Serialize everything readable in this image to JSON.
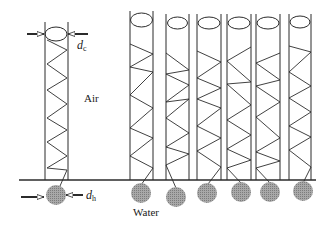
{
  "labels": {
    "air": "Air",
    "water": "Water",
    "dc_var": "d",
    "dc_sub": "c",
    "dh_var": "d",
    "dh_sub": "h"
  },
  "colors": {
    "line": "#2b2b2b",
    "circle_fill": "#9a9a9a",
    "background": "#ffffff"
  },
  "baseline": {
    "x1": 19,
    "x2": 316,
    "y": 180
  },
  "reference_column": {
    "x_left": 45,
    "x_right": 68,
    "top": 22,
    "bottom": 180,
    "ellipse": {
      "cx": 56,
      "cy": 34,
      "rx": 11,
      "ry": 7
    },
    "zigzag": [
      [
        47,
        40
      ],
      [
        67,
        50
      ],
      [
        47,
        64
      ],
      [
        67,
        78
      ],
      [
        47,
        90
      ],
      [
        67,
        104
      ],
      [
        47,
        118
      ],
      [
        67,
        130
      ],
      [
        47,
        142
      ],
      [
        67,
        156
      ],
      [
        47,
        168
      ],
      [
        67,
        170
      ]
    ],
    "tail": [
      [
        67,
        170
      ],
      [
        60,
        186
      ]
    ],
    "drop": {
      "cx": 56,
      "cy": 195,
      "r": 10
    },
    "dc_arrows": {
      "left": [
        27,
        44,
        34
      ],
      "right": [
        88,
        68,
        34
      ]
    },
    "dh_arrows": {
      "left": [
        21,
        44,
        197
      ],
      "right": [
        83,
        66,
        195
      ]
    }
  },
  "columns": [
    {
      "x_left": 130,
      "x_right": 153,
      "top": 11,
      "ellipse": {
        "cy": 20,
        "rx": 11,
        "ry": 7
      },
      "zigzag": [
        [
          130,
          44
        ],
        [
          153,
          54
        ],
        [
          130,
          67
        ],
        [
          153,
          72
        ],
        [
          130,
          95
        ],
        [
          153,
          108
        ],
        [
          130,
          128
        ],
        [
          153,
          138
        ],
        [
          130,
          156
        ],
        [
          153,
          168
        ]
      ],
      "tail": [
        [
          153,
          168
        ],
        [
          141,
          185
        ]
      ],
      "drop": {
        "cx": 141,
        "cy": 193,
        "r": 10
      }
    },
    {
      "x_left": 166,
      "x_right": 189,
      "top": 14,
      "ellipse": {
        "cy": 23,
        "rx": 10,
        "ry": 6
      },
      "zigzag": [
        [
          166,
          53
        ],
        [
          189,
          70
        ],
        [
          166,
          74
        ],
        [
          189,
          85
        ],
        [
          166,
          102
        ],
        [
          189,
          99
        ],
        [
          166,
          118
        ],
        [
          189,
          133
        ],
        [
          166,
          147
        ],
        [
          189,
          154
        ],
        [
          166,
          165
        ]
      ],
      "tail": [
        [
          166,
          165
        ],
        [
          176,
          188
        ]
      ],
      "drop": {
        "cx": 176,
        "cy": 197,
        "r": 10
      }
    },
    {
      "x_left": 197,
      "x_right": 221,
      "top": 14,
      "ellipse": {
        "cy": 23,
        "rx": 11,
        "ry": 6
      },
      "zigzag": [
        [
          197,
          51
        ],
        [
          221,
          62
        ],
        [
          197,
          78
        ],
        [
          221,
          88
        ],
        [
          197,
          99
        ],
        [
          221,
          108
        ],
        [
          197,
          126
        ],
        [
          221,
          138
        ],
        [
          197,
          151
        ],
        [
          221,
          167
        ]
      ],
      "tail": [
        [
          221,
          167
        ],
        [
          208,
          184
        ]
      ],
      "drop": {
        "cx": 207,
        "cy": 193,
        "r": 10
      }
    },
    {
      "x_left": 227,
      "x_right": 251,
      "top": 14,
      "ellipse": {
        "cy": 23,
        "rx": 11,
        "ry": 6
      },
      "zigzag": [
        [
          251,
          47
        ],
        [
          227,
          61
        ],
        [
          251,
          82
        ],
        [
          227,
          84
        ],
        [
          251,
          105
        ],
        [
          227,
          120
        ],
        [
          251,
          135
        ],
        [
          227,
          149
        ],
        [
          251,
          160
        ],
        [
          227,
          168
        ]
      ],
      "tail": [
        [
          227,
          168
        ],
        [
          241,
          183
        ]
      ],
      "drop": {
        "cx": 241,
        "cy": 192,
        "r": 10
      }
    },
    {
      "x_left": 256,
      "x_right": 280,
      "top": 14,
      "ellipse": {
        "cy": 23,
        "rx": 11,
        "ry": 6
      },
      "zigzag": [
        [
          280,
          53
        ],
        [
          256,
          63
        ],
        [
          280,
          80
        ],
        [
          256,
          86
        ],
        [
          280,
          102
        ],
        [
          256,
          117
        ],
        [
          280,
          138
        ],
        [
          256,
          152
        ],
        [
          280,
          161
        ],
        [
          256,
          168
        ]
      ],
      "tail": [
        [
          256,
          168
        ],
        [
          270,
          183
        ]
      ],
      "drop": {
        "cx": 270,
        "cy": 192,
        "r": 10
      }
    },
    {
      "x_left": 289,
      "x_right": 311,
      "top": 14,
      "ellipse": {
        "cy": 22,
        "rx": 10,
        "ry": 6
      },
      "zigzag": [
        [
          289,
          46
        ],
        [
          311,
          52
        ],
        [
          289,
          72
        ],
        [
          311,
          86
        ],
        [
          289,
          98
        ],
        [
          311,
          112
        ],
        [
          289,
          126
        ],
        [
          311,
          137
        ],
        [
          289,
          150
        ],
        [
          311,
          167
        ]
      ],
      "tail": [
        [
          311,
          167
        ],
        [
          303,
          183
        ]
      ],
      "drop": {
        "cx": 303,
        "cy": 191,
        "r": 10
      }
    }
  ]
}
